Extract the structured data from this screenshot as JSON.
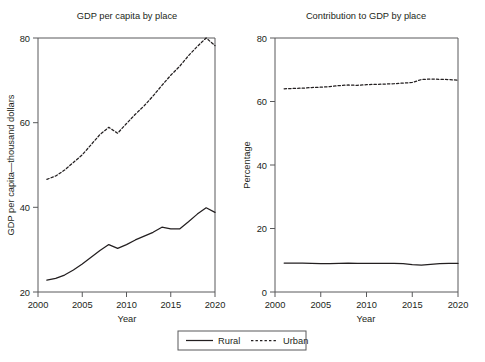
{
  "figure": {
    "width": 485,
    "height": 362,
    "background": "#ffffff",
    "line_color": "#231f20",
    "axis_color": "#58595b"
  },
  "legend": {
    "position": "bottom-center",
    "entries": [
      {
        "label": "Rural",
        "style": "solid"
      },
      {
        "label": "Urban",
        "style": "dashed"
      }
    ]
  },
  "chart_data": [
    {
      "type": "line",
      "title": "GDP per capita by place",
      "xlabel": "Year",
      "ylabel": "GDP per capita—thousand dollars",
      "xlim": [
        2000,
        2020
      ],
      "ylim": [
        20,
        80
      ],
      "xticks": [
        2000,
        2005,
        2010,
        2015,
        2020
      ],
      "yticks": [
        20,
        40,
        60,
        80
      ],
      "grid": false,
      "x": [
        2001,
        2002,
        2003,
        2004,
        2005,
        2006,
        2007,
        2008,
        2009,
        2010,
        2011,
        2012,
        2013,
        2014,
        2015,
        2016,
        2017,
        2018,
        2019,
        2020
      ],
      "series": [
        {
          "name": "Rural",
          "style": "solid",
          "values": [
            22.8,
            23.2,
            24.0,
            25.2,
            26.6,
            28.2,
            29.8,
            31.2,
            30.3,
            31.2,
            32.3,
            33.2,
            34.1,
            35.3,
            34.9,
            34.9,
            36.6,
            38.4,
            39.9,
            38.8
          ]
        },
        {
          "name": "Urban",
          "style": "dashed",
          "values": [
            46.6,
            47.4,
            48.8,
            50.6,
            52.4,
            54.8,
            57.2,
            58.9,
            57.5,
            59.8,
            62.0,
            64.0,
            66.3,
            68.8,
            71.2,
            73.3,
            75.8,
            78.0,
            80.0,
            78.2
          ]
        }
      ]
    },
    {
      "type": "line",
      "title": "Contribution to GDP by place",
      "xlabel": "Year",
      "ylabel": "Percentage",
      "xlim": [
        2000,
        2020
      ],
      "ylim": [
        0,
        80
      ],
      "xticks": [
        2000,
        2005,
        2010,
        2015,
        2020
      ],
      "yticks": [
        0,
        20,
        40,
        60,
        80
      ],
      "grid": false,
      "x": [
        2001,
        2002,
        2003,
        2004,
        2005,
        2006,
        2007,
        2008,
        2009,
        2010,
        2011,
        2012,
        2013,
        2014,
        2015,
        2016,
        2017,
        2018,
        2019,
        2020
      ],
      "series": [
        {
          "name": "Rural",
          "style": "solid",
          "values": [
            9.1,
            9.1,
            9.1,
            9.0,
            8.9,
            8.9,
            9.0,
            9.1,
            9.0,
            9.0,
            9.0,
            9.0,
            9.0,
            8.9,
            8.6,
            8.5,
            8.7,
            8.9,
            9.0,
            9.0
          ]
        },
        {
          "name": "Urban",
          "style": "dashed",
          "values": [
            64.0,
            64.1,
            64.2,
            64.4,
            64.5,
            64.7,
            65.0,
            65.2,
            65.1,
            65.3,
            65.4,
            65.5,
            65.6,
            65.8,
            66.0,
            66.9,
            67.1,
            67.0,
            66.9,
            66.7
          ]
        }
      ]
    }
  ]
}
